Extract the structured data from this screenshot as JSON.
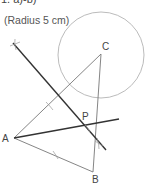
{
  "heading": "1.   a)-b)",
  "note": "(Radius 5 cm)",
  "points": {
    "A": {
      "label": "A",
      "x": 14,
      "y": 138
    },
    "B": {
      "label": "B",
      "x": 93,
      "y": 172
    },
    "C": {
      "label": "C",
      "x": 101,
      "y": 54
    },
    "P": {
      "label": "P"
    }
  },
  "circle": {
    "center": "C",
    "radius_text": "5 cm"
  },
  "colors": {
    "thin_line": "#777777",
    "thick_line": "#333333",
    "circle": "#aaaaaa"
  }
}
